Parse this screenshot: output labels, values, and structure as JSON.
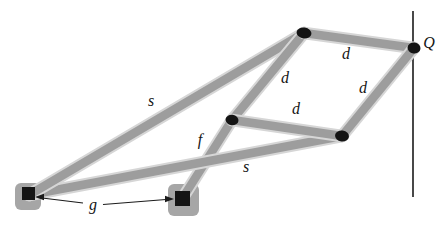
{
  "figure": {
    "type": "peaucellier-straight-line-linkage",
    "background": "#ffffff",
    "colors": {
      "bar_fill": "#9d9d9d",
      "bar_halo": "#d6d6d6",
      "anchor_fill": "#a6a6a6",
      "joint_fill": "#141414",
      "ink": "#1b1b1b"
    },
    "nodes": {
      "O": {
        "x": 29,
        "y": 195,
        "type": "ground-anchor"
      },
      "F": {
        "x": 182,
        "y": 199,
        "type": "ground-anchor"
      },
      "A": {
        "x": 304,
        "y": 33,
        "type": "pin-joint"
      },
      "P": {
        "x": 232,
        "y": 120,
        "type": "pin-joint"
      },
      "B": {
        "x": 342,
        "y": 136,
        "type": "pin-joint"
      },
      "Q": {
        "x": 414,
        "y": 48,
        "type": "pin-joint"
      }
    },
    "bars": [
      {
        "name": "link-f",
        "from": "F",
        "to": "P",
        "length_label": "f"
      },
      {
        "name": "link-s-lower",
        "from": "O",
        "to": "B",
        "length_label": "s"
      },
      {
        "name": "link-s-upper",
        "from": "O",
        "to": "A",
        "length_label": "s"
      },
      {
        "name": "link-d-left",
        "from": "A",
        "to": "P",
        "length_label": "d"
      },
      {
        "name": "link-d-middle",
        "from": "P",
        "to": "B",
        "length_label": "d"
      },
      {
        "name": "link-d-top",
        "from": "A",
        "to": "Q",
        "length_label": "d"
      },
      {
        "name": "link-d-right",
        "from": "Q",
        "to": "B",
        "length_label": "d"
      }
    ],
    "labels": [
      {
        "name": "label-s-upper",
        "text": "s",
        "x": 151,
        "y": 101
      },
      {
        "name": "label-s-lower",
        "text": "s",
        "x": 246,
        "y": 167
      },
      {
        "name": "label-f",
        "text": "f",
        "x": 200,
        "y": 140
      },
      {
        "name": "label-g",
        "text": "g",
        "x": 93,
        "y": 205
      },
      {
        "name": "label-d-top",
        "text": "d",
        "x": 346,
        "y": 54
      },
      {
        "name": "label-d-left",
        "text": "d",
        "x": 285,
        "y": 78
      },
      {
        "name": "label-d-middle",
        "text": "d",
        "x": 296,
        "y": 109
      },
      {
        "name": "label-d-right",
        "text": "d",
        "x": 363,
        "y": 88
      },
      {
        "name": "label-Q",
        "text": "Q",
        "x": 429,
        "y": 43
      }
    ],
    "traced_line": {
      "x": 413,
      "y1": 11,
      "y2": 197
    },
    "dimension_g": {
      "segments": [
        [
          38,
          197.5,
          83,
          203
        ],
        [
          103,
          204.5,
          166,
          199.5
        ]
      ],
      "arrows": [
        {
          "tip": [
            35,
            197
          ],
          "dir": "left"
        },
        {
          "tip": [
            174,
            199
          ],
          "dir": "right"
        }
      ]
    },
    "anchors": [
      {
        "node": "O",
        "rect": [
          15,
          183,
          26,
          27
        ],
        "square": [
          22,
          187,
          13,
          13
        ]
      },
      {
        "node": "F",
        "rect": [
          168,
          184,
          31,
          32
        ],
        "square": [
          175,
          191,
          15,
          15
        ]
      }
    ],
    "joints": [
      {
        "node": "A",
        "rx": 7.5,
        "ry": 5.5,
        "rot": 8
      },
      {
        "node": "P",
        "rx": 6.5,
        "ry": 5.3,
        "rot": 8
      },
      {
        "node": "B",
        "rx": 7.0,
        "ry": 5.5,
        "rot": 8
      },
      {
        "node": "Q",
        "rx": 6.5,
        "ry": 5.5,
        "rot": 8
      }
    ]
  }
}
